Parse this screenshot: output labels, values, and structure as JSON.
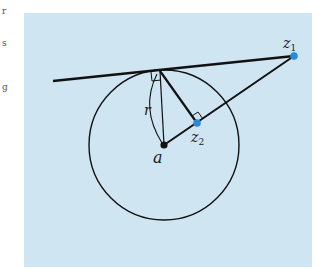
{
  "margin_fragments": [
    "r",
    "s",
    "g"
  ],
  "diagram": {
    "background_color": "#cfe5f2",
    "point_color": "#2a8ad8",
    "line_color": "#111111",
    "labels": {
      "z1": "z",
      "z1_sub": "1",
      "z2": "z",
      "z2_sub": "2",
      "center": "a",
      "radius": "r"
    }
  }
}
